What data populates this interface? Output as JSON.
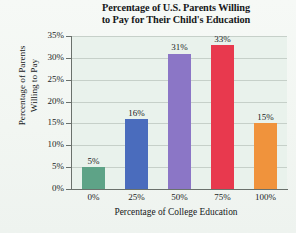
{
  "chart_data": {
    "type": "bar",
    "title": "Percentage of U.S. Parents Willing to Pay for Their Child's Education",
    "title_line1": "Percentage of U.S. Parents Willing",
    "title_line2": "to Pay for Their Child's Education",
    "xlabel": "Percentage of College Education",
    "ylabel": "Percentage of Parents Willing to Pay",
    "ylabel_line1": "Percentage of Parents",
    "ylabel_line2": "Willing to Pay",
    "categories": [
      "0%",
      "25%",
      "50%",
      "75%",
      "100%"
    ],
    "values": [
      5,
      16,
      31,
      33,
      15
    ],
    "value_labels": [
      "5%",
      "16%",
      "31%",
      "33%",
      "15%"
    ],
    "bar_colors": [
      "#5ea387",
      "#4a6cbd",
      "#8b76c6",
      "#e8394e",
      "#f0933c"
    ],
    "ylim": [
      0,
      35
    ],
    "ytick_values": [
      0,
      5,
      10,
      15,
      20,
      25,
      30,
      35
    ],
    "ytick_labels": [
      "0%",
      "5%",
      "10%",
      "15%",
      "20%",
      "25%",
      "30%",
      "35%"
    ],
    "grid": "horizontal",
    "legend": "none",
    "plot_background": "#e9f2ec",
    "axis_color": "#6a716c"
  }
}
